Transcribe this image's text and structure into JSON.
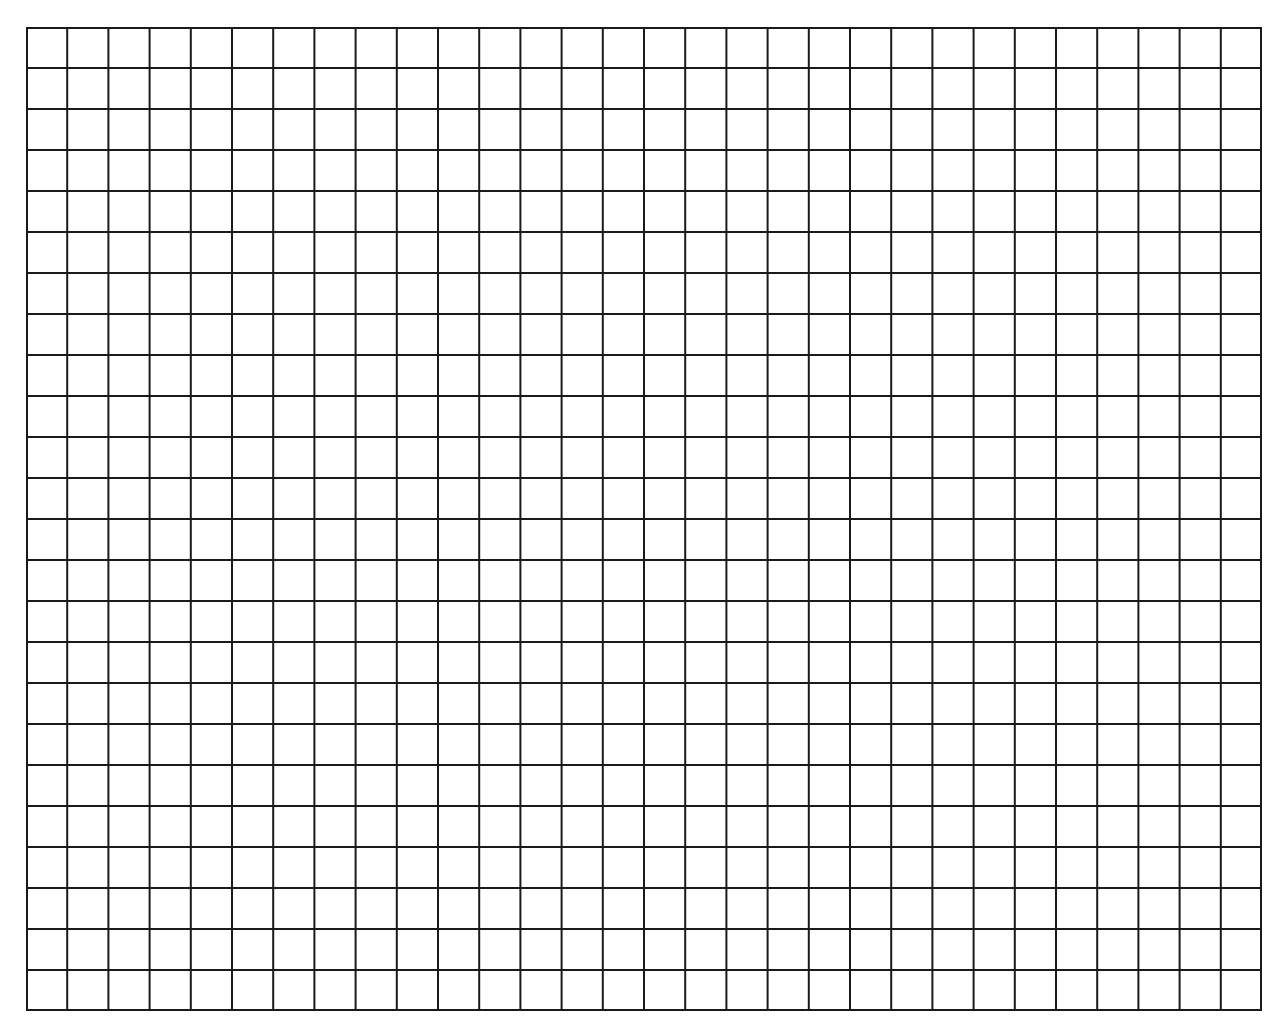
{
  "grid": {
    "columns": 30,
    "rows": 24,
    "line_color": "#1a1a1a",
    "background": "#ffffff",
    "left": 26,
    "top": 27,
    "width": 1236,
    "height": 984
  }
}
